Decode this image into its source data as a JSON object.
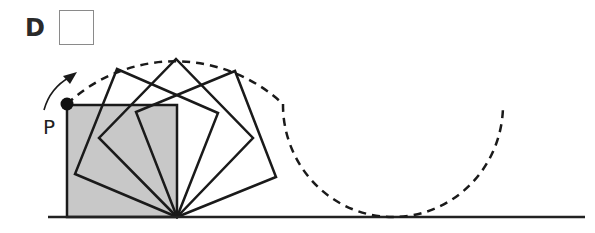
{
  "question": {
    "option_label": "D",
    "answer_box": {
      "value": ""
    }
  },
  "diagram": {
    "point_label": "P",
    "colors": {
      "stroke": "#1a1a1a",
      "square_fill": "#c8c8c8",
      "ground": "#222222"
    },
    "ground_line": {
      "x1": 48,
      "x2": 585,
      "y": 217
    },
    "shaded_square": {
      "x": 67,
      "y": 105,
      "size": 110
    },
    "pivot": {
      "x": 177,
      "y": 217
    },
    "rotated_squares": [
      {
        "points": "177,217 75,174 117,69 218,113"
      },
      {
        "points": "177,217 99,138 176,59 253,138"
      },
      {
        "points": "177,217 136,112 235,71 276,177"
      }
    ],
    "point_p": {
      "x": 67,
      "y": 104
    },
    "locus_arc_1": "M 67 104 A 156 156 0 0 1 283 104",
    "locus_arc_2": "M 283 104 A 110 110 0 0 0 503 104",
    "rotation_arrow": "M 44 108 Q 52 84 74 74"
  }
}
